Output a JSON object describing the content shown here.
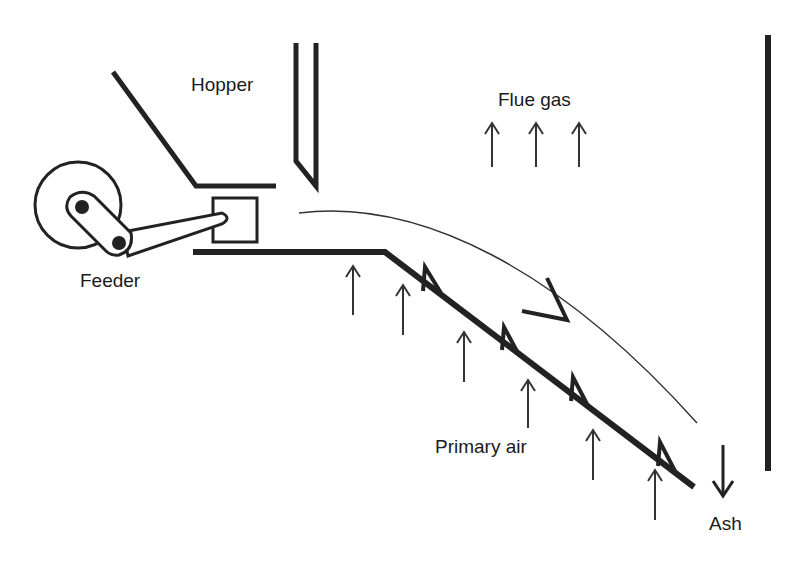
{
  "diagram": {
    "type": "stoker grate furnace schematic",
    "labels": {
      "hopper": "Hopper",
      "feeder": "Feeder",
      "flue_gas": "Flue gas",
      "primary_air": "Primary air",
      "ash": "Ash"
    },
    "colors": {
      "stroke": "#222222",
      "thin_stroke": "#333333",
      "background": "#ffffff"
    },
    "flue_gas_arrows": 3,
    "primary_air_arrows": 6,
    "grate_fins": 4
  }
}
